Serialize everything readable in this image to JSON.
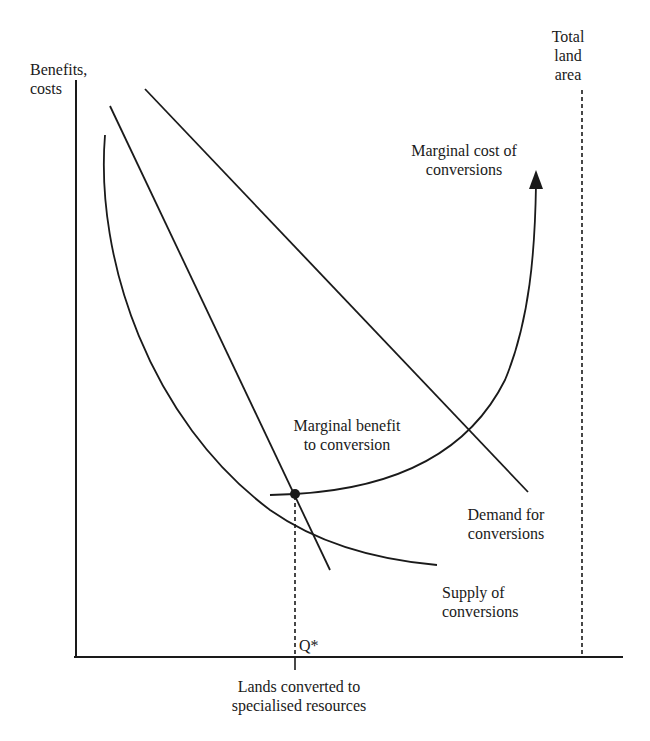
{
  "diagram": {
    "type": "economics supply-demand diagram",
    "y_axis": {
      "label_line1": "Benefits,",
      "label_line2": "costs"
    },
    "x_axis": {
      "label_line1": "Lands converted to",
      "label_line2": "specialised resources"
    },
    "boundary": {
      "label_line1": "Total",
      "label_line2": "land",
      "label_line3": "area"
    },
    "equilibrium": {
      "label": "Q*"
    },
    "curves": {
      "marginal_cost": {
        "label_line1": "Marginal cost of",
        "label_line2": "conversions"
      },
      "marginal_benefit": {
        "label_line1": "Marginal benefit",
        "label_line2": "to conversion"
      },
      "demand": {
        "label_line1": "Demand for",
        "label_line2": "conversions"
      },
      "supply": {
        "label_line1": "Supply of",
        "label_line2": "conversions"
      }
    },
    "colors": {
      "ink": "#1a1a1a",
      "background": "#ffffff"
    }
  }
}
